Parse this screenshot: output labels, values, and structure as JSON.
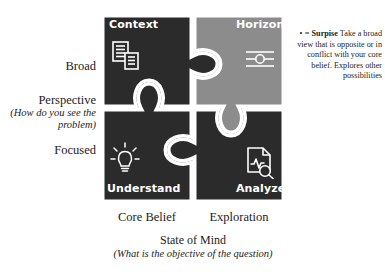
{
  "diagram": {
    "title_caption": "State of Mind",
    "title_caption_sub": "(What is the objective of the question)",
    "y_axis": {
      "top_label": "Broad",
      "title": "Perspective",
      "title_sub": "(How do you see the problem)",
      "bottom_label": "Focused"
    },
    "x_axis": {
      "left_label": "Core Belief",
      "right_label": "Exploration"
    },
    "quadrants": [
      {
        "id": "context",
        "label": "Context",
        "icon": "documents-icon",
        "fill": "#2b2b2b",
        "position": "top-left"
      },
      {
        "id": "horizon",
        "label": "Horizon",
        "icon": "slider-icon",
        "fill": "#8c8c8c",
        "position": "top-right"
      },
      {
        "id": "understand",
        "label": "Understand",
        "icon": "lightbulb-icon",
        "fill": "#2b2b2b",
        "position": "bottom-left"
      },
      {
        "id": "analyze",
        "label": "Analyze",
        "icon": "document-magnifier-icon",
        "fill": "#2b2b2b",
        "position": "bottom-right"
      }
    ],
    "note": {
      "bullet_symbol": "•",
      "equals": "=",
      "term": "Surpise",
      "text": "Take a broad view that is opposite or in conflict with your core belief. Explores other possibilities"
    },
    "colors": {
      "dark_piece": "#2b2b2b",
      "light_piece": "#8c8c8c",
      "outline": "#ffffff",
      "text": "#1c1c1c",
      "piece_text": "#ffffff",
      "background": "#ffffff"
    }
  }
}
